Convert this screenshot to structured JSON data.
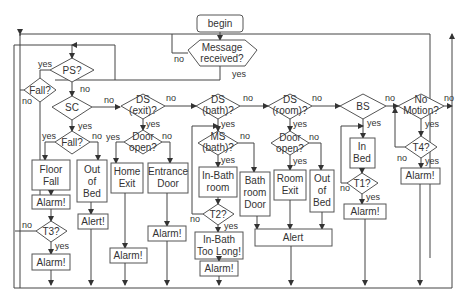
{
  "diagram": {
    "start": "begin",
    "message": {
      "l1": "Message",
      "l2": "received?"
    },
    "ps": "PS?",
    "fall_top": "Fall?",
    "sc": "SC",
    "fall_mid": "Fall?",
    "floor_fall": {
      "l1": "Floor",
      "l2": "Fall"
    },
    "alarm1": "Alarm!",
    "t3": "T3?",
    "alarm2": "Alarm!",
    "out_of_bed1": {
      "l1": "Out",
      "l2": "of",
      "l3": "Bed"
    },
    "alert1": "Alert!",
    "ds_exit": {
      "l1": "DS",
      "l2": "(exit)?"
    },
    "door_open1": {
      "l1": "Door",
      "l2": "open?"
    },
    "home_exit": {
      "l1": "Home",
      "l2": "Exit"
    },
    "entrance_door": {
      "l1": "Entrance",
      "l2": "Door"
    },
    "alarm3": "Alarm!",
    "alarm4": "Alarm!",
    "ds_bath": {
      "l1": "DS",
      "l2": "(bath)?"
    },
    "ms_bath": {
      "l1": "MS",
      "l2": "(bath)?"
    },
    "in_bathroom": {
      "l1": "In-Bath",
      "l2": "room"
    },
    "t2": "T2?",
    "in_bath_too_long": {
      "l1": "In-Bath",
      "l2": "Too Long!"
    },
    "alarm5": "Alarm!",
    "bathroom_door": {
      "l1": "Bath",
      "l2": "room",
      "l3": "Door"
    },
    "ds_room": {
      "l1": "DS",
      "l2": "(room)?"
    },
    "door_open2": {
      "l1": "Door",
      "l2": "open?"
    },
    "room_exit": {
      "l1": "Room",
      "l2": "Exit"
    },
    "out_of_bed2": {
      "l1": "Out",
      "l2": "of",
      "l3": "Bed"
    },
    "alert2": "Alert",
    "bs": "BS",
    "in_bed": {
      "l1": "In",
      "l2": "Bed"
    },
    "t1": "T1?",
    "alarm6": "Alarm!",
    "no_motion": {
      "l1": "No",
      "l2": "Motion?"
    },
    "t4": "T4?",
    "alarm7": "Alarm!",
    "labels": {
      "yes": "yes",
      "no": "no"
    }
  }
}
